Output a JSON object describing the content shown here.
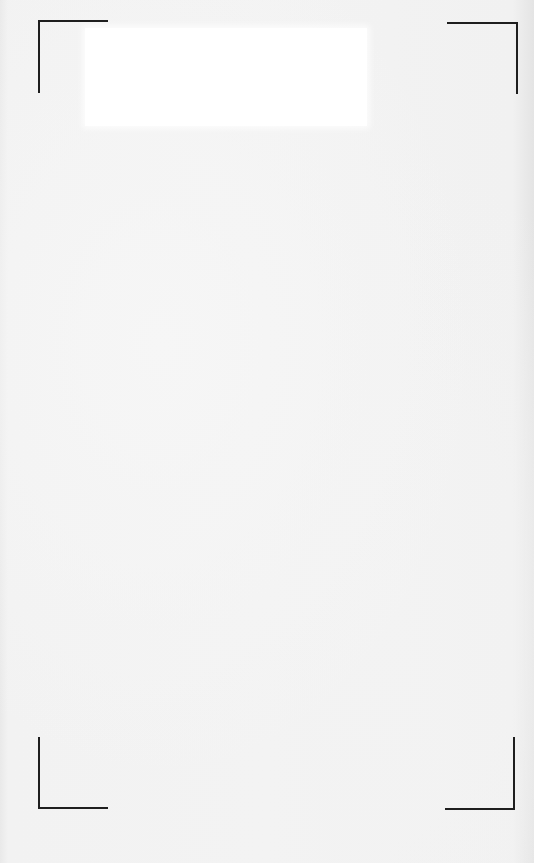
{
  "page": {
    "type": "blank scanned page",
    "background_color": "#f0f0f0",
    "label_area_color": "#ffffff",
    "mark_color": "#1e1e1e"
  },
  "crop_marks": [
    {
      "position": "top-left"
    },
    {
      "position": "top-right"
    },
    {
      "position": "bottom-left"
    },
    {
      "position": "bottom-right"
    }
  ]
}
